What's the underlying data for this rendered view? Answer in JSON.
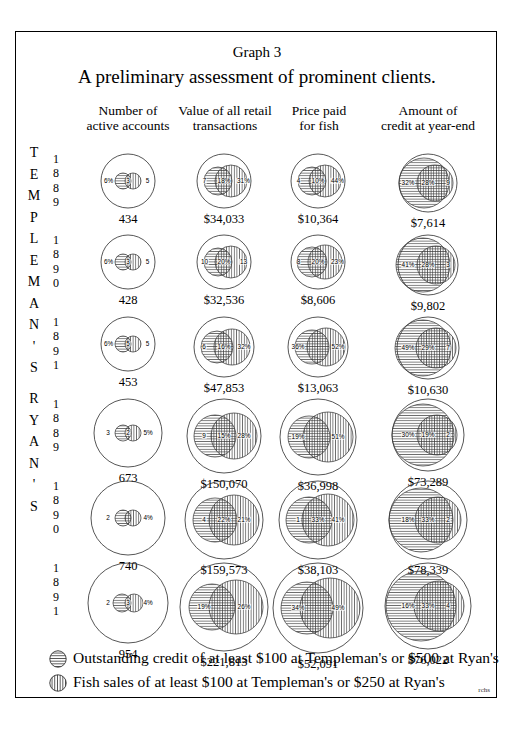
{
  "titles": {
    "graph_number": "Graph 3",
    "main": "A preliminary assessment of prominent clients."
  },
  "column_headers": [
    {
      "line1": "Number of",
      "line2": "active accounts"
    },
    {
      "line1": "Value of all retail",
      "line2": "transactions"
    },
    {
      "line1": "Price paid",
      "line2": "for fish"
    },
    {
      "line1": "Amount of",
      "line2": "credit at year-end"
    }
  ],
  "brands": [
    {
      "name": "TEMPLEMAN'S",
      "letters": "T E M P L E M A N ' S"
    },
    {
      "name": "RYAN'S",
      "letters": "R Y A N ' S"
    }
  ],
  "years": [
    "1889",
    "1890",
    "1891",
    "1889",
    "1890",
    "1891"
  ],
  "signature": "rchs",
  "legend": [
    {
      "swatch": "horizontal-hatch",
      "label": "Outstanding credit of at least $100 at Templeman's or $500 at Ryan's"
    },
    {
      "swatch": "vertical-hatch",
      "label": "Fish sales of at least $100 at Templeman's or $250 at Ryan's"
    }
  ],
  "chart_data": {
    "type": "bar",
    "title": "A preliminary assessment of prominent clients.",
    "subtitle": "Graph 3",
    "xlabel": "",
    "ylabel": "",
    "series_legend": [
      "Outstanding credit of at least $100 at Templeman's or $500 at Ryan's",
      "Fish sales of at least $100 at Templeman's or $250 at Ryan's"
    ],
    "categories": [
      "Number of active accounts",
      "Value of all retail transactions",
      "Price paid for fish",
      "Amount of credit at year-end"
    ],
    "rows": [
      {
        "store": "TEMPLEMAN'S",
        "year": "1889",
        "cells": [
          {
            "total": "434",
            "labels": [
              "6%",
              "3",
              "5"
            ]
          },
          {
            "total": "$34,033",
            "labels": [
              "7",
              "18%",
              "31%"
            ]
          },
          {
            "total": "$10,364",
            "labels": [
              "4",
              "10%",
              "44%"
            ]
          },
          {
            "total": "$7,614",
            "labels": [
              "32%",
              "28%",
              "9"
            ]
          }
        ]
      },
      {
        "store": "TEMPLEMAN'S",
        "year": "1890",
        "cells": [
          {
            "total": "428",
            "labels": [
              "6%",
              "3",
              "5"
            ]
          },
          {
            "total": "$32,536",
            "labels": [
              "10",
              "20%",
              "13"
            ]
          },
          {
            "total": "$8,606",
            "labels": [
              "8",
              "20%",
              "23%"
            ]
          },
          {
            "total": "$9,802",
            "labels": [
              "41%",
              "28%",
              "3"
            ]
          }
        ]
      },
      {
        "store": "TEMPLEMAN'S",
        "year": "1891",
        "cells": [
          {
            "total": "453",
            "labels": [
              "6%",
              "5",
              "5"
            ]
          },
          {
            "total": "$47,853",
            "labels": [
              "6",
              "16%",
              "32%"
            ]
          },
          {
            "total": "$13,063",
            "labels": [
              "36%",
              "52%"
            ]
          },
          {
            "total": "$10,630",
            "labels": [
              "49%",
              "29%",
              "7"
            ]
          }
        ]
      },
      {
        "store": "RYAN'S",
        "year": "1889",
        "cells": [
          {
            "total": "673",
            "labels": [
              "3",
              "2",
              "5%"
            ]
          },
          {
            "total": "$150,070",
            "labels": [
              "9",
              "15%",
              "28%"
            ]
          },
          {
            "total": "$36,998",
            "labels": [
              "19%",
              "51%"
            ]
          },
          {
            "total": "$73,289",
            "labels": [
              "30%",
              "19%",
              "2"
            ]
          }
        ]
      },
      {
        "store": "RYAN'S",
        "year": "1890",
        "cells": [
          {
            "total": "740",
            "labels": [
              "2",
              "4%"
            ]
          },
          {
            "total": "$159,573",
            "labels": [
              "4",
              "22%",
              "21%"
            ]
          },
          {
            "total": "$38,103",
            "labels": [
              "1",
              "33%",
              "41%"
            ]
          },
          {
            "total": "$78,339",
            "labels": [
              "18%",
              "33%",
              "2"
            ]
          }
        ]
      },
      {
        "store": "RYAN'S",
        "year": "1891",
        "cells": [
          {
            "total": "954",
            "labels": [
              "2",
              "3",
              "4%"
            ]
          },
          {
            "total": "$221,813",
            "labels": [
              "19%",
              "26%"
            ]
          },
          {
            "total": "$52,091",
            "labels": [
              "34%",
              "49%"
            ]
          },
          {
            "total": "$76,022",
            "labels": [
              "16%",
              "33%",
              "4"
            ]
          }
        ]
      }
    ]
  }
}
